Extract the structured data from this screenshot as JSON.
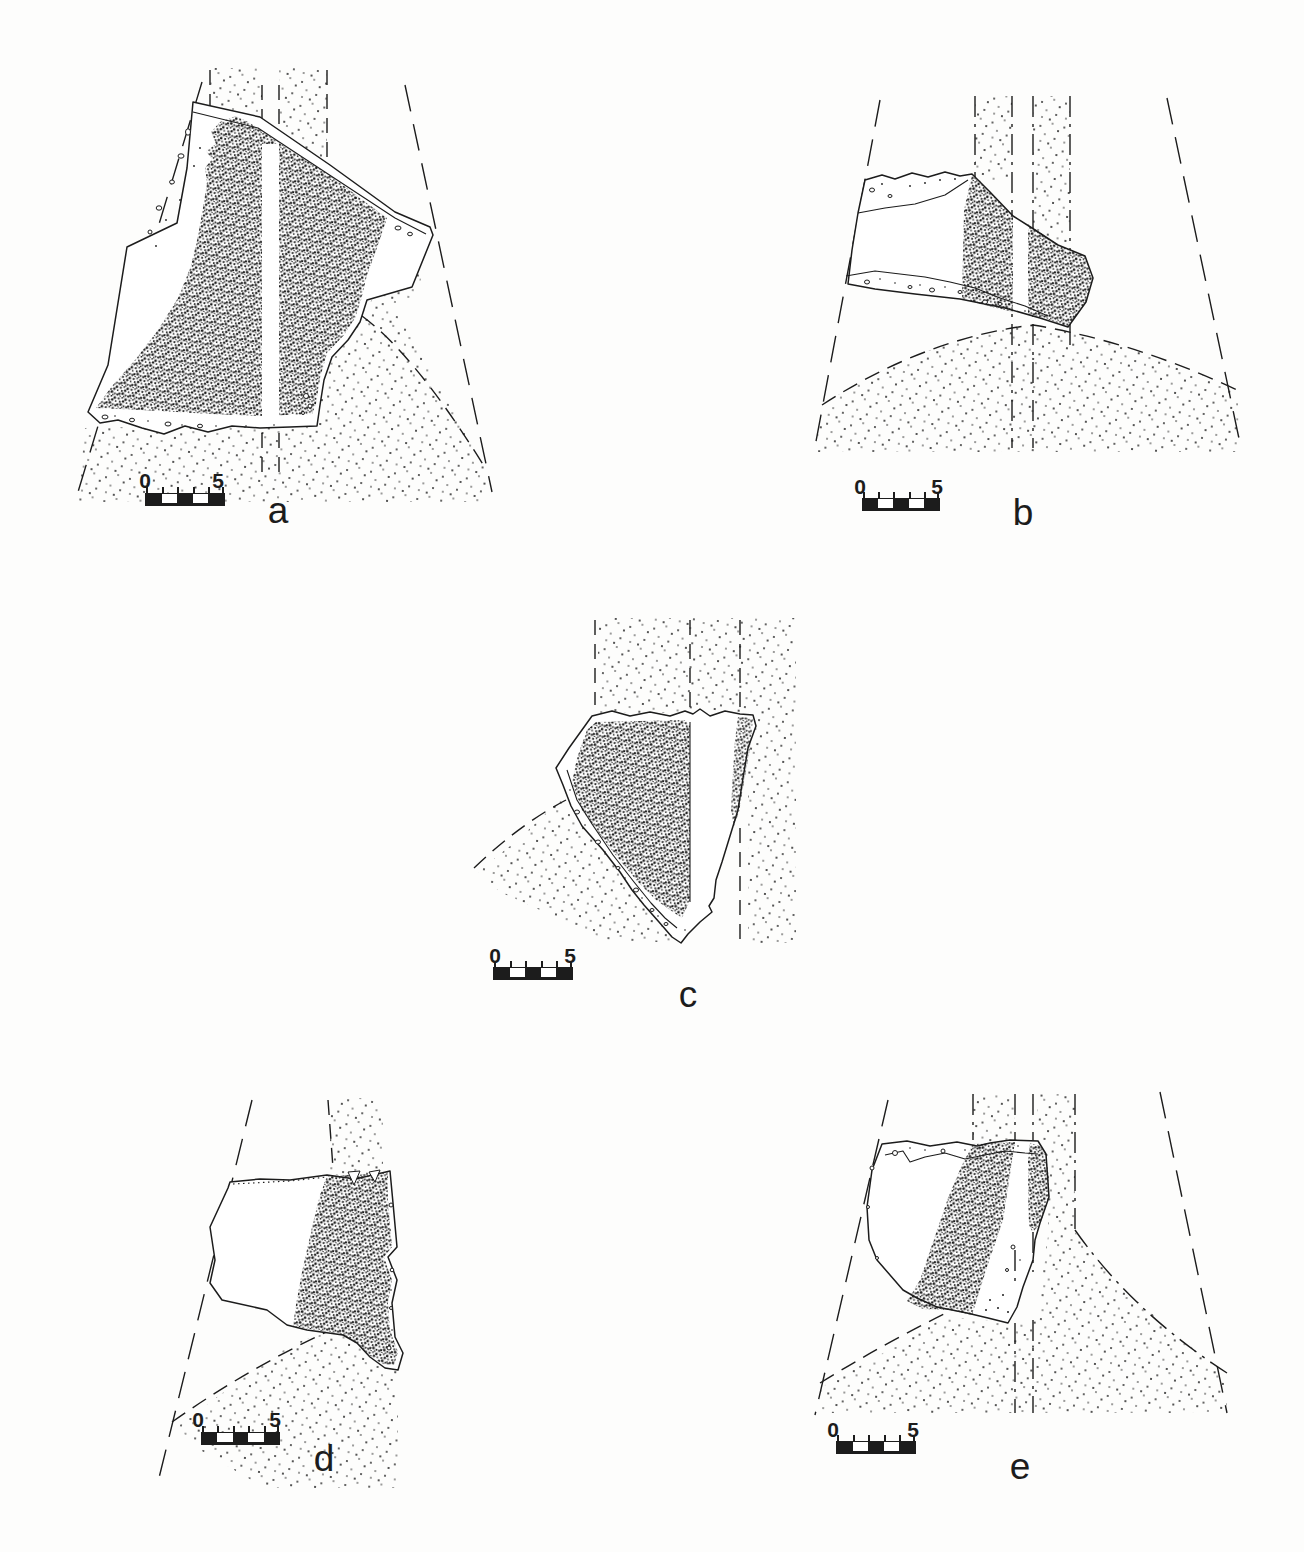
{
  "figure": {
    "ink_color": "#1c1c1c",
    "paper_color": "#fdfdfc",
    "panels": [
      {
        "id": "a",
        "label": "a",
        "scale_start": "0",
        "scale_end": "5"
      },
      {
        "id": "b",
        "label": "b",
        "scale_start": "0",
        "scale_end": "5"
      },
      {
        "id": "c",
        "label": "c",
        "scale_start": "0",
        "scale_end": "5"
      },
      {
        "id": "d",
        "label": "d",
        "scale_start": "0",
        "scale_end": "5"
      },
      {
        "id": "e",
        "label": "e",
        "scale_start": "0",
        "scale_end": "5"
      }
    ]
  }
}
